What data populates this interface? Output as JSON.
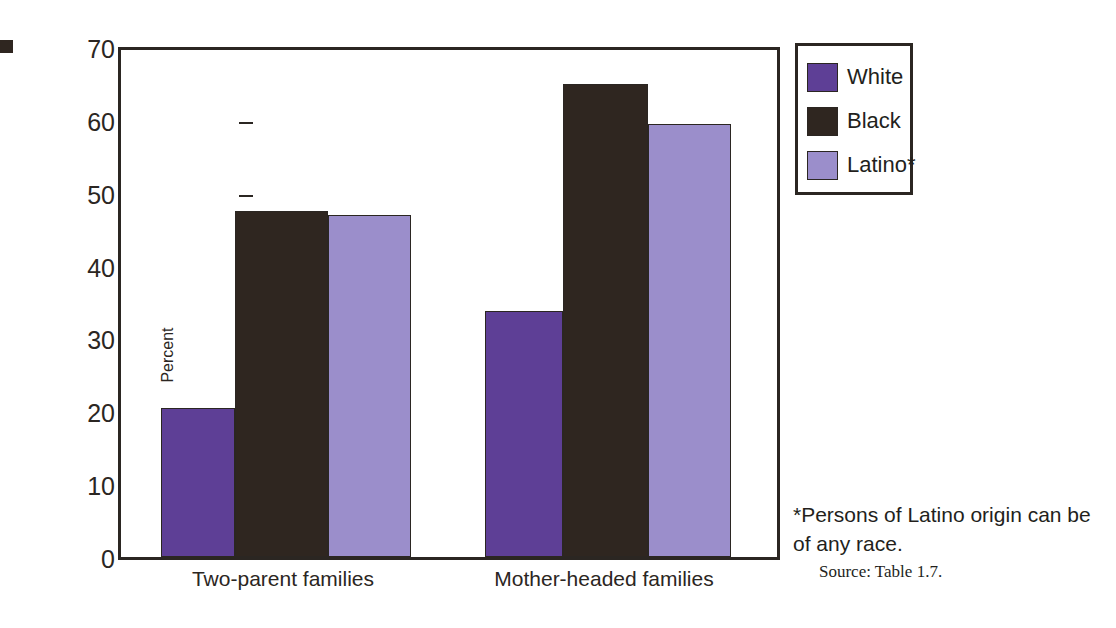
{
  "chart_data": {
    "type": "bar",
    "title": "",
    "xlabel": "",
    "ylabel": "Percent",
    "categories": [
      "Two-parent families",
      "Mother-headed families"
    ],
    "series": [
      {
        "name": "White",
        "color": "#5e3f96",
        "values": [
          20.4,
          33.7
        ]
      },
      {
        "name": "Black",
        "color": "#2f2620",
        "values": [
          47.5,
          64.9
        ]
      },
      {
        "name": "Latino*",
        "color": "#9b8ecb",
        "values": [
          46.9,
          59.5
        ]
      }
    ],
    "ylim": [
      0,
      70
    ],
    "yticks": [
      0,
      10,
      20,
      30,
      40,
      50,
      60,
      70
    ],
    "ytick_labels": [
      "0",
      "10",
      "20",
      "30",
      "40",
      "50",
      "60",
      "70"
    ],
    "grid": false,
    "legend_position": "upper right"
  },
  "axis": {
    "y_title": "Percent",
    "ticks": [
      "70",
      "60",
      "50",
      "40",
      "30",
      "20",
      "10",
      "0"
    ]
  },
  "legend": {
    "items": [
      {
        "label": "White"
      },
      {
        "label": "Black"
      },
      {
        "label": "Latino*"
      }
    ]
  },
  "notes": {
    "footnote": "*Persons of Latino origin can be of any race.",
    "source": "Source: Table 1.7."
  }
}
